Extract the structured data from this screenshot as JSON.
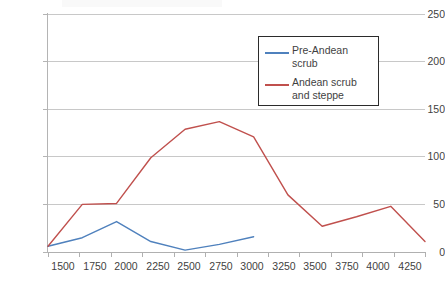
{
  "chart_data": {
    "type": "line",
    "title": "",
    "subtitle": "",
    "xlabel": "",
    "ylabel": "",
    "x": [
      1500,
      1750,
      2000,
      2250,
      2500,
      2750,
      3000,
      3250,
      3500,
      3750,
      4000,
      4250
    ],
    "xlim": [
      1500,
      4250
    ],
    "ylim": [
      0,
      250
    ],
    "grid": true,
    "legend_position": "top-right",
    "yticks": [
      0,
      50,
      100,
      150,
      200,
      250
    ],
    "xticks": [
      "1500",
      "1750",
      "2000",
      "2250",
      "2500",
      "2750",
      "3000",
      "3250",
      "3500",
      "3750",
      "4000",
      "4250"
    ],
    "series": [
      {
        "name": "Pre-Andean scrub",
        "color": "#4f81bd",
        "x": [
          1500,
          1750,
          2000,
          2250,
          2500,
          2750,
          3000
        ],
        "values": [
          6,
          15,
          32,
          11,
          2,
          8,
          16
        ]
      },
      {
        "name": "Andean scrub and steppe",
        "color": "#c0504d",
        "x": [
          1500,
          1750,
          2000,
          2250,
          2500,
          2750,
          3000,
          3250,
          3500,
          3750,
          4000,
          4250
        ],
        "values": [
          6,
          50,
          51,
          99,
          129,
          137,
          121,
          60,
          27,
          37,
          48,
          11
        ]
      }
    ]
  },
  "axes": {
    "y_labels": [
      "250",
      "200",
      "150",
      "100",
      "50",
      "0"
    ],
    "x_labels": [
      "1500",
      "1750",
      "2000",
      "2250",
      "2500",
      "2750",
      "3000",
      "3250",
      "3500",
      "3750",
      "4000",
      "4250"
    ]
  },
  "legend": {
    "entries": [
      {
        "label": "Pre-Andean\nscrub",
        "color": "#4f81bd"
      },
      {
        "label": "Andean scrub\nand steppe",
        "color": "#c0504d"
      }
    ]
  },
  "colors": {
    "series_1": "#4f81bd",
    "series_2": "#c0504d",
    "gridline": "#c8c8c8",
    "axis": "#b4b4b4",
    "text": "#3f3f3f",
    "legend_border": "#2b2b2b",
    "background": "#ffffff"
  }
}
